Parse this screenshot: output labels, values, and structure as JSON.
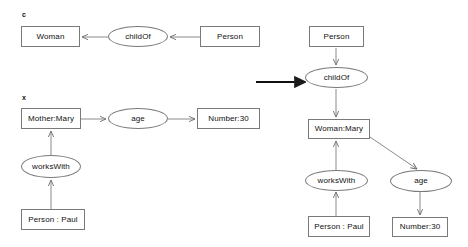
{
  "figure": {
    "background_color": "#ffffff",
    "stroke_color": "#7a7a7a",
    "text_color": "#111111",
    "transform_arrow": {
      "name": "transformation-arrow",
      "direction": "right",
      "x1": 256,
      "y1": 82,
      "x2": 305,
      "y2": 82
    }
  },
  "left_panel": {
    "labels": [
      {
        "text": "c",
        "x": 22,
        "y": 11
      },
      {
        "text": "x",
        "x": 22,
        "y": 94
      }
    ],
    "nodes": [
      {
        "id": "l-woman",
        "shape": "rect",
        "label": "Woman",
        "x": 21,
        "y": 26,
        "w": 59,
        "h": 21
      },
      {
        "id": "l-childof",
        "shape": "ellipse",
        "label": "childOf",
        "x": 108,
        "y": 26,
        "w": 60,
        "h": 21
      },
      {
        "id": "l-person",
        "shape": "rect",
        "label": "Person",
        "x": 200,
        "y": 26,
        "w": 60,
        "h": 21
      },
      {
        "id": "l-mothermary",
        "shape": "rect",
        "label": "Mother:Mary",
        "x": 21,
        "y": 108,
        "w": 60,
        "h": 21
      },
      {
        "id": "l-age",
        "shape": "ellipse",
        "label": "age",
        "x": 108,
        "y": 108,
        "w": 60,
        "h": 21
      },
      {
        "id": "l-number30",
        "shape": "rect",
        "label": "Number:30",
        "x": 197,
        "y": 108,
        "w": 63,
        "h": 21
      },
      {
        "id": "l-workswith",
        "shape": "ellipse",
        "label": "worksWith",
        "x": 21,
        "y": 155,
        "w": 60,
        "h": 23
      },
      {
        "id": "l-personpaul",
        "shape": "rect",
        "label": "Person : Paul",
        "x": 21,
        "y": 209,
        "w": 64,
        "h": 21
      }
    ],
    "edges": [
      {
        "name": "edge-childof-to-woman",
        "x1": 108,
        "y1": 37,
        "x2": 82,
        "y2": 37
      },
      {
        "name": "edge-person-to-childof",
        "x1": 200,
        "y1": 37,
        "x2": 170,
        "y2": 37
      },
      {
        "name": "edge-mothermary-to-age",
        "x1": 81,
        "y1": 119,
        "x2": 106,
        "y2": 119
      },
      {
        "name": "edge-age-to-number30",
        "x1": 168,
        "y1": 119,
        "x2": 195,
        "y2": 119
      },
      {
        "name": "edge-workswith-to-mothermary",
        "x1": 51,
        "y1": 155,
        "x2": 51,
        "y2": 131
      },
      {
        "name": "edge-personpaul-to-workswith",
        "x1": 51,
        "y1": 209,
        "x2": 51,
        "y2": 180
      }
    ]
  },
  "right_panel": {
    "nodes": [
      {
        "id": "r-person",
        "shape": "rect",
        "label": "Person",
        "x": 309,
        "y": 26,
        "w": 55,
        "h": 21
      },
      {
        "id": "r-childof",
        "shape": "ellipse",
        "label": "childOf",
        "x": 305,
        "y": 67,
        "w": 63,
        "h": 21
      },
      {
        "id": "r-womanmary",
        "shape": "rect",
        "label": "Woman:Mary",
        "x": 308,
        "y": 119,
        "w": 62,
        "h": 20
      },
      {
        "id": "r-workswith",
        "shape": "ellipse",
        "label": "worksWith",
        "x": 305,
        "y": 170,
        "w": 63,
        "h": 21
      },
      {
        "id": "r-age",
        "shape": "ellipse",
        "label": "age",
        "x": 390,
        "y": 170,
        "w": 62,
        "h": 22
      },
      {
        "id": "r-personpaul",
        "shape": "rect",
        "label": "Person : Paul",
        "x": 308,
        "y": 216,
        "w": 62,
        "h": 21
      },
      {
        "id": "r-number30",
        "shape": "rect",
        "label": "Number:30",
        "x": 392,
        "y": 217,
        "w": 56,
        "h": 20
      }
    ],
    "edges": [
      {
        "name": "edge-person-to-childof",
        "x1": 336,
        "y1": 48,
        "x2": 336,
        "y2": 65
      },
      {
        "name": "edge-childof-to-womanmary",
        "x1": 336,
        "y1": 89,
        "x2": 336,
        "y2": 117
      },
      {
        "name": "edge-workswith-to-womanmary",
        "x1": 336,
        "y1": 170,
        "x2": 336,
        "y2": 141
      },
      {
        "name": "edge-personpaul-to-workswith",
        "x1": 336,
        "y1": 216,
        "x2": 336,
        "y2": 192
      },
      {
        "name": "edge-womanmary-to-age",
        "x1": 370,
        "y1": 137,
        "x2": 417,
        "y2": 169
      },
      {
        "name": "edge-age-to-number30",
        "x1": 420,
        "y1": 192,
        "x2": 420,
        "y2": 215
      }
    ]
  }
}
